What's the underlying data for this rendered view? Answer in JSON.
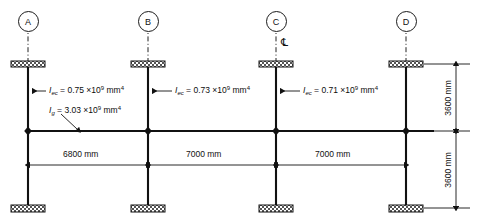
{
  "diagram": {
    "grid_bubbles": [
      {
        "label": "A",
        "x": 28
      },
      {
        "label": "B",
        "x": 148
      },
      {
        "label": "C",
        "x": 276
      },
      {
        "label": "D",
        "x": 406
      }
    ],
    "centerline_symbol": "℄",
    "column_labels": [
      {
        "sym": "I",
        "sub": "ec",
        "eq": "= 0.75 ×10",
        "sup": "9",
        "unit": "mm",
        "unit_sup": "4"
      },
      {
        "sym": "I",
        "sub": "ec",
        "eq": "= 0.73 ×10",
        "sup": "9",
        "unit": "mm",
        "unit_sup": "4"
      },
      {
        "sym": "I",
        "sub": "ec",
        "eq": "= 0.71 ×10",
        "sup": "9",
        "unit": "mm",
        "unit_sup": "4"
      }
    ],
    "beam_label": {
      "sym": "I",
      "sub": "g",
      "eq": "= 3.03 ×10",
      "sup": "9",
      "unit": "mm",
      "unit_sup": "4"
    },
    "horizontal_dimensions": [
      {
        "text": "6800 mm",
        "from": "A",
        "to": "B"
      },
      {
        "text": "7000 mm",
        "from": "B",
        "to": "C"
      },
      {
        "text": "7000 mm",
        "from": "C",
        "to": "D"
      }
    ],
    "vertical_dimensions": [
      {
        "text": "3600 mm",
        "position": "upper"
      },
      {
        "text": "3600 mm",
        "position": "lower"
      }
    ],
    "colors": {
      "line": "#111111",
      "text": "#0d0d0d",
      "hatch": "#4d4d4d",
      "background": "#ffffff"
    }
  }
}
